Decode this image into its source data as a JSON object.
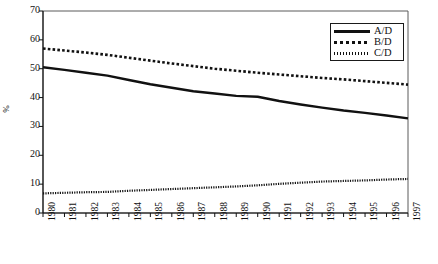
{
  "chart_data": {
    "type": "line",
    "title": "",
    "xlabel": "",
    "ylabel": "%",
    "ylim": [
      0,
      70
    ],
    "ytick_values": [
      0,
      10,
      20,
      30,
      40,
      50,
      60,
      70
    ],
    "grid": false,
    "legend_position": "top-right",
    "categories": [
      "1980",
      "1981",
      "1982",
      "1983",
      "1984",
      "1985",
      "1986",
      "1987",
      "1988",
      "1989",
      "1990",
      "1991",
      "1992",
      "1993",
      "1994",
      "1995",
      "1996",
      "1997"
    ],
    "series": [
      {
        "name": "A/D",
        "style": "solid",
        "values": [
          50.5,
          49.6,
          48.6,
          47.6,
          46.1,
          44.6,
          43.4,
          42.2,
          41.4,
          40.6,
          40.3,
          38.8,
          37.6,
          36.5,
          35.5,
          34.7,
          33.8,
          32.8
        ]
      },
      {
        "name": "B/D",
        "style": "dotted-coarse",
        "values": [
          57.0,
          56.3,
          55.6,
          54.8,
          53.8,
          52.8,
          51.8,
          50.9,
          50.0,
          49.3,
          48.6,
          48.0,
          47.4,
          46.8,
          46.3,
          45.7,
          45.1,
          44.5
        ]
      },
      {
        "name": "C/D",
        "style": "dotted-fine",
        "values": [
          6.8,
          7.0,
          7.2,
          7.3,
          7.7,
          8.0,
          8.3,
          8.6,
          8.9,
          9.2,
          9.6,
          10.1,
          10.5,
          10.9,
          11.1,
          11.3,
          11.6,
          11.8
        ]
      }
    ]
  },
  "legend": {
    "items": [
      {
        "label": "A/D"
      },
      {
        "label": "B/D"
      },
      {
        "label": "C/D"
      }
    ]
  },
  "axis": {
    "y_title": "%"
  }
}
